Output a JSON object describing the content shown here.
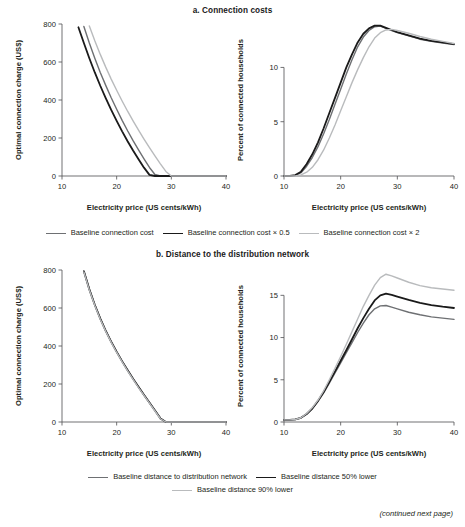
{
  "figure": {
    "footer_note": "(continued next page)"
  },
  "panels": [
    {
      "id": "a",
      "title": "a. Connection costs"
    },
    {
      "id": "b",
      "title": "b. Distance to the distribution network"
    }
  ],
  "legends": {
    "a": [
      {
        "label": "Baseline connection cost",
        "color": "#6e7073",
        "width": 1.4
      },
      {
        "label": "Baseline connection cost × 0.5",
        "color": "#1a1a1a",
        "width": 1.8
      },
      {
        "label": "Baseline connection cost × 2",
        "color": "#b9bbbd",
        "width": 1.4
      }
    ],
    "b": [
      {
        "label": "Baseline distance to distribution network",
        "color": "#6e7073",
        "width": 1.4
      },
      {
        "label": "Baseline distance 50% lower",
        "color": "#1a1a1a",
        "width": 1.8
      },
      {
        "label": "Baseline distance 90% lower",
        "color": "#b9bbbd",
        "width": 1.4
      }
    ]
  },
  "chart_data": [
    {
      "id": "a-left",
      "type": "line",
      "title": "a. Connection costs",
      "xlabel": "Electricity price (US cents/kWh)",
      "ylabel": "Optimal connection charge (US$)",
      "xlim": [
        10,
        40
      ],
      "ylim": [
        0,
        800
      ],
      "xticks": [
        10,
        20,
        30,
        40
      ],
      "yticks": [
        0,
        200,
        400,
        600,
        800
      ],
      "grid": false,
      "legend_position": "below",
      "x": [
        10,
        11,
        12,
        13,
        14,
        15,
        16,
        17,
        18,
        19,
        20,
        21,
        22,
        23,
        24,
        25,
        26,
        27,
        28,
        29,
        30,
        32,
        34,
        36,
        38,
        40
      ],
      "series": [
        {
          "name": "Baseline connection cost",
          "color": "#6e7073",
          "width": 1.4,
          "values": [
            null,
            null,
            null,
            null,
            787,
            700,
            620,
            545,
            477,
            412,
            351,
            293,
            238,
            186,
            137,
            90,
            45,
            8,
            0,
            0,
            0,
            0,
            0,
            0,
            0,
            0
          ]
        },
        {
          "name": "Baseline connection cost × 0.5",
          "color": "#1a1a1a",
          "width": 1.8,
          "values": [
            null,
            null,
            null,
            783,
            700,
            620,
            545,
            475,
            410,
            348,
            290,
            235,
            183,
            134,
            88,
            44,
            6,
            0,
            0,
            0,
            0,
            0,
            0,
            0,
            0,
            0
          ]
        },
        {
          "name": "Baseline connection cost × 2",
          "color": "#b9bbbd",
          "width": 1.4,
          "values": [
            null,
            null,
            null,
            null,
            null,
            790,
            712,
            640,
            573,
            510,
            451,
            395,
            341,
            290,
            241,
            194,
            149,
            106,
            64,
            24,
            0,
            0,
            0,
            0,
            0,
            0
          ]
        }
      ]
    },
    {
      "id": "a-right",
      "type": "line",
      "title": "a. Connection costs",
      "xlabel": "Electricity price (US cents/kWh)",
      "ylabel": "Percent of connected households",
      "xlim": [
        10,
        40
      ],
      "ylim": [
        0,
        14
      ],
      "xticks": [
        10,
        20,
        30,
        40
      ],
      "yticks": [
        0,
        5,
        10
      ],
      "grid": false,
      "legend_position": "below",
      "x": [
        10,
        11,
        12,
        13,
        14,
        15,
        16,
        17,
        18,
        19,
        20,
        21,
        22,
        23,
        24,
        25,
        26,
        27,
        28,
        29,
        30,
        32,
        34,
        36,
        38,
        40
      ],
      "series": [
        {
          "name": "Baseline connection cost",
          "color": "#6e7073",
          "width": 1.4,
          "values": [
            0,
            0,
            0.05,
            0.3,
            0.9,
            1.7,
            2.7,
            3.9,
            5.2,
            6.6,
            8.0,
            9.4,
            10.7,
            11.9,
            12.8,
            13.4,
            13.75,
            13.8,
            13.6,
            13.4,
            13.2,
            12.9,
            12.6,
            12.4,
            12.25,
            12.1
          ]
        },
        {
          "name": "Baseline connection cost × 0.5",
          "color": "#1a1a1a",
          "width": 1.8,
          "values": [
            0,
            0,
            0.08,
            0.4,
            1.1,
            2.0,
            3.1,
            4.4,
            5.8,
            7.2,
            8.6,
            10.0,
            11.2,
            12.3,
            13.1,
            13.6,
            13.85,
            13.85,
            13.65,
            13.45,
            13.25,
            12.95,
            12.65,
            12.45,
            12.3,
            12.15
          ]
        },
        {
          "name": "Baseline connection cost × 2",
          "color": "#b9bbbd",
          "width": 1.4,
          "values": [
            0,
            0,
            0,
            0.1,
            0.35,
            0.8,
            1.5,
            2.4,
            3.5,
            4.7,
            6.0,
            7.3,
            8.6,
            9.8,
            10.9,
            11.9,
            12.7,
            13.2,
            13.45,
            13.5,
            13.4,
            13.15,
            12.85,
            12.6,
            12.4,
            12.2
          ]
        }
      ]
    },
    {
      "id": "b-left",
      "type": "line",
      "title": "b. Distance to the distribution network",
      "xlabel": "Electricity price (US cents/kWh)",
      "ylabel": "Optimal connection charge (US$)",
      "xlim": [
        10,
        40
      ],
      "ylim": [
        0,
        800
      ],
      "xticks": [
        10,
        20,
        30,
        40
      ],
      "yticks": [
        0,
        200,
        400,
        600,
        800
      ],
      "grid": false,
      "legend_position": "below",
      "x": [
        10,
        11,
        12,
        13,
        14,
        15,
        16,
        17,
        18,
        19,
        20,
        21,
        22,
        23,
        24,
        25,
        26,
        27,
        28,
        29,
        30,
        32,
        34,
        36,
        38,
        40
      ],
      "series": [
        {
          "name": "Baseline distance to distribution network",
          "color": "#6e7073",
          "width": 1.4,
          "values": [
            null,
            null,
            null,
            null,
            795,
            700,
            618,
            546,
            482,
            424,
            371,
            321,
            274,
            229,
            186,
            144,
            103,
            62,
            20,
            0,
            0,
            0,
            0,
            0,
            0,
            0
          ]
        },
        {
          "name": "Baseline distance 50% lower",
          "color": "#1a1a1a",
          "width": 1.8,
          "values": [
            null,
            null,
            null,
            null,
            793,
            698,
            616,
            544,
            480,
            422,
            369,
            319,
            272,
            227,
            184,
            142,
            101,
            60,
            19,
            0,
            0,
            0,
            0,
            0,
            0,
            0
          ]
        },
        {
          "name": "Baseline distance 90% lower",
          "color": "#b9bbbd",
          "width": 1.4,
          "values": [
            null,
            null,
            null,
            null,
            790,
            695,
            613,
            541,
            477,
            419,
            366,
            316,
            269,
            224,
            181,
            140,
            99,
            58,
            17,
            0,
            0,
            0,
            0,
            0,
            0,
            0
          ]
        }
      ]
    },
    {
      "id": "b-right",
      "type": "line",
      "title": "b. Distance to the distribution network",
      "xlabel": "Electricity price (US cents/kWh)",
      "ylabel": "Percent of connected households",
      "xlim": [
        10,
        40
      ],
      "ylim": [
        0,
        18
      ],
      "xticks": [
        10,
        20,
        30,
        40
      ],
      "yticks": [
        0,
        5,
        10,
        15
      ],
      "grid": false,
      "legend_position": "below",
      "x": [
        10,
        11,
        12,
        13,
        14,
        15,
        16,
        17,
        18,
        19,
        20,
        21,
        22,
        23,
        24,
        25,
        26,
        27,
        28,
        29,
        30,
        32,
        34,
        36,
        38,
        40
      ],
      "series": [
        {
          "name": "Baseline distance to distribution network",
          "color": "#6e7073",
          "width": 1.4,
          "values": [
            0.25,
            0.25,
            0.3,
            0.5,
            0.95,
            1.6,
            2.45,
            3.45,
            4.6,
            5.8,
            7.0,
            8.2,
            9.4,
            10.6,
            11.7,
            12.7,
            13.4,
            13.75,
            13.8,
            13.6,
            13.4,
            13.0,
            12.7,
            12.45,
            12.3,
            12.15
          ]
        },
        {
          "name": "Baseline distance 50% lower",
          "color": "#1a1a1a",
          "width": 1.8,
          "values": [
            0.25,
            0.25,
            0.3,
            0.5,
            0.95,
            1.6,
            2.5,
            3.55,
            4.75,
            6.0,
            7.25,
            8.5,
            9.8,
            11.1,
            12.3,
            13.4,
            14.4,
            15.0,
            15.2,
            15.05,
            14.85,
            14.45,
            14.1,
            13.85,
            13.65,
            13.5
          ]
        },
        {
          "name": "Baseline distance 90% lower",
          "color": "#b9bbbd",
          "width": 1.4,
          "values": [
            0.25,
            0.25,
            0.3,
            0.5,
            1.0,
            1.7,
            2.6,
            3.7,
            5.0,
            6.35,
            7.75,
            9.2,
            10.7,
            12.2,
            13.7,
            15.0,
            16.2,
            17.1,
            17.5,
            17.3,
            17.05,
            16.55,
            16.15,
            15.9,
            15.75,
            15.6
          ]
        }
      ]
    }
  ]
}
